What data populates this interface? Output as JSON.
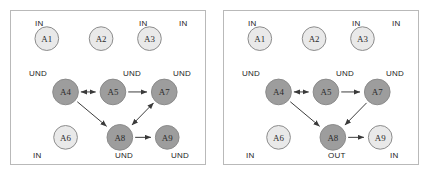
{
  "figure": {
    "background": "#ffffff",
    "panel_border_color": "#b9b9b9",
    "node_light_color": "#e9e9e9",
    "node_dark_color": "#9d9d9d",
    "edge_color": "#3a3a3a"
  },
  "panels": [
    {
      "id": "left",
      "nodes": [
        {
          "id": "A1",
          "label": "A1",
          "cx": 36,
          "cy": 28,
          "r": 12,
          "shade": "light"
        },
        {
          "id": "A2",
          "label": "A2",
          "cx": 91,
          "cy": 28,
          "r": 12,
          "shade": "light"
        },
        {
          "id": "A3",
          "label": "A3",
          "cx": 140,
          "cy": 28,
          "r": 12,
          "shade": "light"
        },
        {
          "id": "A4",
          "label": "A4",
          "cx": 55,
          "cy": 82,
          "r": 13,
          "shade": "dark"
        },
        {
          "id": "A5",
          "label": "A5",
          "cx": 103,
          "cy": 82,
          "r": 13,
          "shade": "dark"
        },
        {
          "id": "A7",
          "label": "A7",
          "cx": 155,
          "cy": 82,
          "r": 13,
          "shade": "dark"
        },
        {
          "id": "A6",
          "label": "A6",
          "cx": 55,
          "cy": 128,
          "r": 12,
          "shade": "light"
        },
        {
          "id": "A8",
          "label": "A8",
          "cx": 110,
          "cy": 128,
          "r": 13,
          "shade": "dark"
        },
        {
          "id": "A9",
          "label": "A9",
          "cx": 158,
          "cy": 128,
          "r": 12,
          "shade": "dark"
        }
      ],
      "edges": [
        {
          "from": "A4",
          "to": "A5",
          "arrow": "both"
        },
        {
          "from": "A5",
          "to": "A7",
          "arrow": "end"
        },
        {
          "from": "A4",
          "to": "A8",
          "arrow": "end"
        },
        {
          "from": "A7",
          "to": "A8",
          "arrow": "both"
        },
        {
          "from": "A8",
          "to": "A9",
          "arrow": "end"
        }
      ],
      "labels": [
        {
          "text": "IN",
          "x": 24,
          "y": 8
        },
        {
          "text": "IN",
          "x": 128,
          "y": 8
        },
        {
          "text": "IN",
          "x": 168,
          "y": 8
        },
        {
          "text": "UND",
          "x": 18,
          "y": 58
        },
        {
          "text": "UND",
          "x": 112,
          "y": 58
        },
        {
          "text": "UND",
          "x": 162,
          "y": 58
        },
        {
          "text": "IN",
          "x": 22,
          "y": 140
        },
        {
          "text": "UND",
          "x": 104,
          "y": 140
        },
        {
          "text": "UND",
          "x": 160,
          "y": 140
        }
      ]
    },
    {
      "id": "right",
      "nodes": [
        {
          "id": "A1",
          "label": "A1",
          "cx": 36,
          "cy": 28,
          "r": 12,
          "shade": "light"
        },
        {
          "id": "A2",
          "label": "A2",
          "cx": 91,
          "cy": 28,
          "r": 12,
          "shade": "light"
        },
        {
          "id": "A3",
          "label": "A3",
          "cx": 140,
          "cy": 28,
          "r": 12,
          "shade": "light"
        },
        {
          "id": "A4",
          "label": "A4",
          "cx": 55,
          "cy": 82,
          "r": 13,
          "shade": "dark"
        },
        {
          "id": "A5",
          "label": "A5",
          "cx": 103,
          "cy": 82,
          "r": 13,
          "shade": "dark"
        },
        {
          "id": "A7",
          "label": "A7",
          "cx": 155,
          "cy": 82,
          "r": 13,
          "shade": "dark"
        },
        {
          "id": "A6",
          "label": "A6",
          "cx": 55,
          "cy": 128,
          "r": 12,
          "shade": "light"
        },
        {
          "id": "A8",
          "label": "A8",
          "cx": 110,
          "cy": 128,
          "r": 13,
          "shade": "dark"
        },
        {
          "id": "A9",
          "label": "A9",
          "cx": 158,
          "cy": 128,
          "r": 12,
          "shade": "light"
        }
      ],
      "edges": [
        {
          "from": "A4",
          "to": "A5",
          "arrow": "both"
        },
        {
          "from": "A5",
          "to": "A7",
          "arrow": "end"
        },
        {
          "from": "A4",
          "to": "A8",
          "arrow": "end"
        },
        {
          "from": "A7",
          "to": "A8",
          "arrow": "end"
        },
        {
          "from": "A8",
          "to": "A9",
          "arrow": "end"
        }
      ],
      "labels": [
        {
          "text": "IN",
          "x": 24,
          "y": 8
        },
        {
          "text": "IN",
          "x": 128,
          "y": 8
        },
        {
          "text": "IN",
          "x": 168,
          "y": 8
        },
        {
          "text": "UND",
          "x": 18,
          "y": 58
        },
        {
          "text": "UND",
          "x": 112,
          "y": 58
        },
        {
          "text": "UND",
          "x": 162,
          "y": 58
        },
        {
          "text": "IN",
          "x": 22,
          "y": 140
        },
        {
          "text": "OUT",
          "x": 104,
          "y": 140
        },
        {
          "text": "IN",
          "x": 166,
          "y": 140
        }
      ]
    }
  ]
}
